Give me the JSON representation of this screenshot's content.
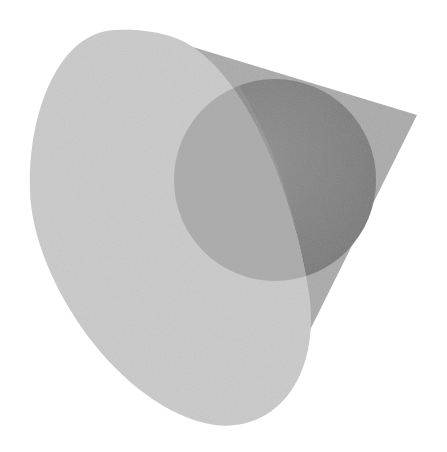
{
  "scene": {
    "description": "3D render of a translucent cone with an inscribed sphere",
    "background": "#ffffff",
    "objects": [
      {
        "name": "cone-base",
        "shape": "ellipse",
        "color": "#c9c9c9"
      },
      {
        "name": "cone-side",
        "shape": "cone-lateral-surface",
        "color": "#a9a9a9",
        "apex": [
          417,
          115
        ]
      },
      {
        "name": "sphere",
        "shape": "sphere",
        "color": "#8e8e8e",
        "center": [
          275,
          180
        ],
        "radius": 101
      }
    ]
  }
}
